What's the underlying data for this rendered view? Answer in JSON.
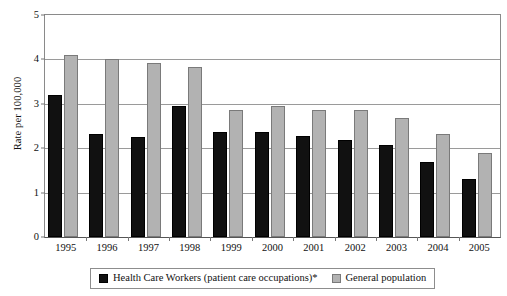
{
  "chart_data": {
    "type": "bar",
    "title": "",
    "xlabel": "",
    "ylabel": "Rate per 100,000",
    "ylim": [
      0,
      5
    ],
    "yticks": [
      0,
      1,
      2,
      3,
      4,
      5
    ],
    "ytick_labels": [
      "0",
      "1",
      "2",
      "3",
      "4",
      "5"
    ],
    "grid": true,
    "legend_position": "bottom",
    "categories": [
      "1995",
      "1996",
      "1997",
      "1998",
      "1999",
      "2000",
      "2001",
      "2002",
      "2003",
      "2004",
      "2005"
    ],
    "series": [
      {
        "name": "Health Care Workers (patient care occupations)*",
        "color": "#111111",
        "values": [
          3.2,
          2.33,
          2.25,
          2.95,
          2.36,
          2.37,
          2.27,
          2.19,
          2.08,
          1.69,
          1.3
        ]
      },
      {
        "name": "General population",
        "color": "#b2b2b2",
        "values": [
          4.11,
          4.01,
          3.93,
          3.83,
          2.85,
          2.96,
          2.86,
          2.87,
          2.67,
          2.32,
          1.9
        ]
      }
    ]
  },
  "legend": {
    "items": [
      {
        "label": "Health Care Workers (patient care occupations)*",
        "swatch": "black-square-swatch"
      },
      {
        "label": "General population",
        "swatch": "gray-square-swatch"
      }
    ]
  },
  "colors": {
    "series_hcw": "#111111",
    "series_general": "#b2b2b2",
    "gridline": "#9a9a9a",
    "axis": "#555555",
    "background": "#ffffff"
  }
}
